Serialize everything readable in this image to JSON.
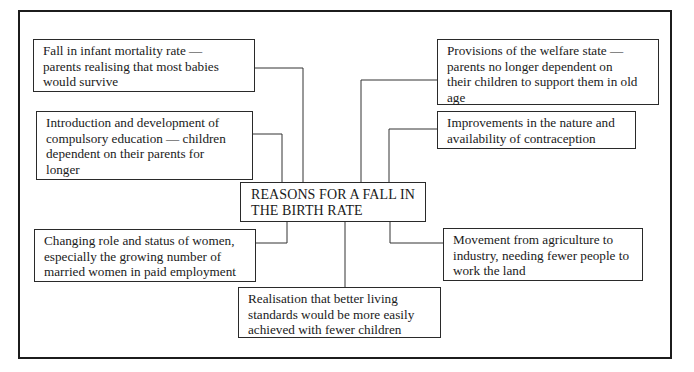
{
  "diagram": {
    "title_lines": [
      "REASONS FOR A FALL IN",
      "THE BIRTH RATE"
    ],
    "reasons": [
      {
        "id": "infant-mortality",
        "lines": [
          "Fall in infant mortality rate —",
          "parents realising that most babies",
          "would survive"
        ]
      },
      {
        "id": "compulsory-education",
        "lines": [
          "Introduction and development of",
          "compulsory education — children",
          "dependent on their parents for",
          "longer"
        ]
      },
      {
        "id": "welfare-state",
        "lines": [
          "Provisions of the welfare state —",
          "parents no longer dependent on",
          "their children to support them in old",
          "age"
        ]
      },
      {
        "id": "contraception",
        "lines": [
          "Improvements in the nature and",
          "availability of contraception"
        ]
      },
      {
        "id": "women-role",
        "lines": [
          "Changing role and status of women,",
          "especially the growing number of",
          "married women in paid employment"
        ]
      },
      {
        "id": "agriculture-industry",
        "lines": [
          "Movement from agriculture to",
          "industry, needing fewer people to",
          "work the land"
        ]
      },
      {
        "id": "living-standards",
        "lines": [
          "Realisation that better living",
          "standards would be more easily",
          "achieved with fewer children"
        ]
      }
    ]
  }
}
